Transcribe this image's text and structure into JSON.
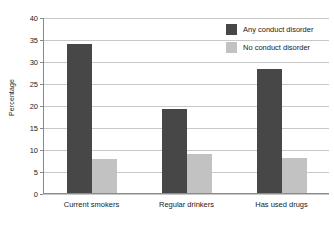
{
  "chart_data": {
    "type": "bar",
    "title": "",
    "xlabel": "",
    "ylabel": "Percentage",
    "ylim": [
      0,
      40
    ],
    "yticks": [
      0,
      5,
      10,
      15,
      20,
      25,
      30,
      35,
      40
    ],
    "ytick_labels": [
      "0",
      "5",
      "10",
      "15",
      "20",
      "25",
      "30",
      "35",
      "40"
    ],
    "grid": true,
    "legend_position": "top-right",
    "categories": [
      "Current smokers",
      "Regular drinkers",
      "Has used drugs"
    ],
    "series": [
      {
        "name": "Any conduct disorder",
        "color": "#474747",
        "values": [
          34.0,
          19.1,
          28.3
        ]
      },
      {
        "name": "No conduct disorder",
        "color": "#c2c2c2",
        "values": [
          7.7,
          8.9,
          8.1
        ]
      }
    ]
  },
  "axis": {
    "y_title": "Percentage"
  }
}
